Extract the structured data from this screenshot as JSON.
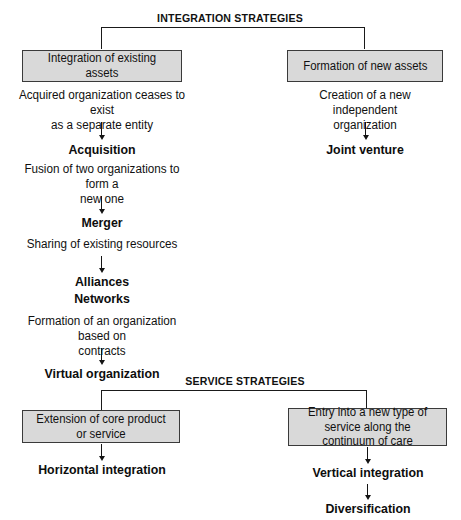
{
  "diagram": {
    "colors": {
      "box_fill": "#d9d9d9",
      "box_border": "#3a3a3a",
      "line": "#1a1a1a",
      "text": "#111111",
      "background": "#ffffff"
    }
  },
  "sections": [
    {
      "id": "integration",
      "label": "INTEGRATION STRATEGIES"
    },
    {
      "id": "service",
      "label": "SERVICE STRATEGIES"
    }
  ],
  "boxes": [
    {
      "id": "integration-existing-assets",
      "label": "Integration of existing assets"
    },
    {
      "id": "formation-new-assets",
      "label": "Formation of new assets"
    },
    {
      "id": "extension-core-product",
      "label": "Extension of core product or service"
    },
    {
      "id": "entry-new-service-line1",
      "label": "Entry into a new type of service"
    },
    {
      "id": "entry-new-service-line2",
      "label": "along the continuum of care"
    }
  ],
  "descriptions": [
    {
      "id": "acquired-organization",
      "line1": "Acquired organization ceases to exist",
      "line2": "as a separate entity"
    },
    {
      "id": "creation-new-organization",
      "line1": "Creation of a new independent",
      "line2": "organization"
    },
    {
      "id": "fusion-two-organizations",
      "line1": "Fusion of two organizations to form a",
      "line2": "new one"
    },
    {
      "id": "sharing-existing-resources",
      "line1": "Sharing of existing resources",
      "line2": ""
    },
    {
      "id": "formation-contracts",
      "line1": "Formation of an organization based on",
      "line2": "contracts"
    }
  ],
  "terms": [
    {
      "id": "acquisition",
      "label": "Acquisition"
    },
    {
      "id": "merger",
      "label": "Merger"
    },
    {
      "id": "alliances",
      "label": "Alliances"
    },
    {
      "id": "networks",
      "label": "Networks"
    },
    {
      "id": "virtual-organization",
      "label": "Virtual organization"
    },
    {
      "id": "joint-venture",
      "label": "Joint venture"
    },
    {
      "id": "horizontal-integration",
      "label": "Horizontal integration"
    },
    {
      "id": "vertical-integration",
      "label": "Vertical integration"
    },
    {
      "id": "diversification",
      "label": "Diversification"
    }
  ]
}
